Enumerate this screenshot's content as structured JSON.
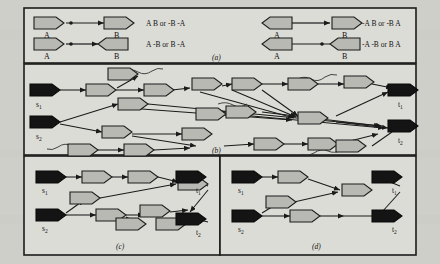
{
  "figure": {
    "background_color": "#d3d3ce",
    "border_color": "#1c1c1c",
    "gene_fill": "#b9b9b4",
    "terminal_fill": "#141414",
    "edge_color": "#1a1a1a",
    "panels": [
      {
        "id": "a",
        "caption": "(a)",
        "rows": [
          {
            "left_graph": {
              "nodes": [
                {
                  "label": "A",
                  "orientation": "right"
                },
                {
                  "label": "B",
                  "orientation": "right"
                }
              ]
            },
            "left_text": "A B or -B -A",
            "right_graph": {
              "nodes": [
                {
                  "label": "A",
                  "orientation": "left"
                },
                {
                  "label": "B",
                  "orientation": "right"
                }
              ]
            },
            "right_text": "-A B or -B A"
          },
          {
            "left_graph": {
              "nodes": [
                {
                  "label": "A",
                  "orientation": "right"
                },
                {
                  "label": "B",
                  "orientation": "left"
                }
              ]
            },
            "left_text": "A -B or B -A",
            "right_graph": {
              "nodes": [
                {
                  "label": "A",
                  "orientation": "left"
                },
                {
                  "label": "B",
                  "orientation": "left"
                }
              ]
            },
            "right_text": "-A -B or B A"
          }
        ]
      },
      {
        "id": "b",
        "caption": "(b)",
        "terminals": [
          {
            "label": "s1",
            "sub": "1",
            "base": "s",
            "role": "source"
          },
          {
            "label": "s2",
            "sub": "2",
            "base": "s",
            "role": "source"
          },
          {
            "label": "t1",
            "sub": "1",
            "base": "t",
            "role": "sink"
          },
          {
            "label": "t2",
            "sub": "2",
            "base": "t",
            "role": "sink"
          }
        ],
        "gene_node_count": 18,
        "dangling_tail_count": 5
      },
      {
        "id": "c",
        "caption": "(c)",
        "terminals": [
          {
            "label": "s1",
            "sub": "1",
            "base": "s",
            "role": "source"
          },
          {
            "label": "s2",
            "sub": "2",
            "base": "s",
            "role": "source"
          },
          {
            "label": "t1",
            "sub": "1",
            "base": "t",
            "role": "sink"
          },
          {
            "label": "t2",
            "sub": "2",
            "base": "t",
            "role": "sink"
          }
        ],
        "gene_node_count": 8
      },
      {
        "id": "d",
        "caption": "(d)",
        "terminals": [
          {
            "label": "s1",
            "sub": "1",
            "base": "s",
            "role": "source"
          },
          {
            "label": "s2",
            "sub": "2",
            "base": "s",
            "role": "source"
          },
          {
            "label": "t1",
            "sub": "1",
            "base": "t",
            "role": "sink"
          },
          {
            "label": "t2",
            "sub": "2",
            "base": "t",
            "role": "sink"
          }
        ],
        "gene_node_count": 4
      }
    ]
  }
}
